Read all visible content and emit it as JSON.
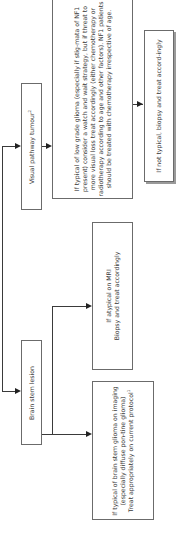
{
  "diagram": {
    "orientation": "rotated-90-ccw",
    "nodes": {
      "visual_pathway": {
        "label": "Visual pathway tumour",
        "sup": "2"
      },
      "brain_stem": {
        "label": "Brain stem lesion"
      },
      "low_grade_glioma": {
        "label": "If typical of low grade glioma (especially if stig-mata of NF1 present) consider a watch and wait strategy, but if threat to more visual loss treat accordingly (either chemotherapy or radiotherapy according to age and other factors). NF1 patients should be treated with chemotherapy irrespective of age."
      },
      "not_typical": {
        "label": "If not typical, biopsy and treat accord-ingly"
      },
      "atypical_mri": {
        "line1": "If atypical on MRI",
        "line2": "Biopsy and treat accordingly"
      },
      "brain_stem_glioma": {
        "line1": "If typical of brain stem glioma on imaging (especially diffuse pon-tine glioma)",
        "line2": "Treat appropriately on current protocol",
        "sup": "1"
      }
    },
    "edges": [
      {
        "from": "root",
        "to": "visual_pathway"
      },
      {
        "from": "root",
        "to": "brain_stem"
      },
      {
        "from": "visual_pathway",
        "to": "low_grade_glioma"
      },
      {
        "from": "low_grade_glioma",
        "to": "not_typical"
      },
      {
        "from": "brain_stem",
        "to": "atypical_mri"
      },
      {
        "from": "brain_stem",
        "to": "brain_stem_glioma"
      }
    ],
    "colors": {
      "border": "#6b6b6b",
      "line": "#3a3a3a",
      "text": "#3a3a3a",
      "background": "#ffffff"
    }
  }
}
